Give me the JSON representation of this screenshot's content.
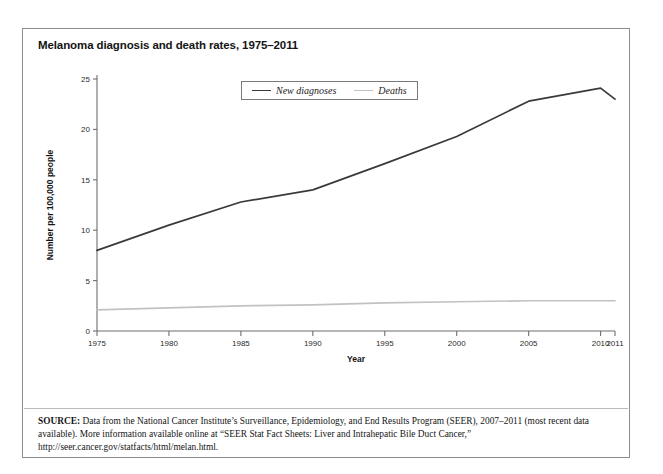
{
  "figure": {
    "title": "Melanoma diagnosis and death rates, 1975–2011",
    "source_label": "SOURCE:",
    "source_text": " Data from the National Cancer Institute’s Surveillance, Epidemiology, and End Results Program (SEER), 2007–2011 (most recent data available). More information available online at “SEER Stat Fact Sheets: Liver and Intrahepatic Bile Duct Cancer,” http://seer.cancer.gov/statfacts/html/melan.html."
  },
  "colors": {
    "frame_border": "#8c8c8c",
    "axis": "#6e6e6e",
    "new_diagnoses_line": "#3a3a3a",
    "deaths_line": "#c2c2c2",
    "title_text": "#141414",
    "note_text": "#151515"
  },
  "chart_data": {
    "type": "line",
    "title": "Melanoma diagnosis and death rates, 1975–2011",
    "xlabel": "Year",
    "ylabel": "Number per 100,000 people",
    "xlim": [
      1975,
      2011
    ],
    "ylim": [
      0,
      25
    ],
    "grid": false,
    "legend_position": "top-center",
    "x_tick_labels": [
      "1975",
      "1980",
      "1985",
      "1990",
      "1995",
      "2000",
      "2005",
      "2010",
      "2011"
    ],
    "x_ticks": [
      1975,
      1980,
      1985,
      1990,
      1995,
      2000,
      2005,
      2010,
      2011
    ],
    "y_tick_labels": [
      "0",
      "5",
      "10",
      "15",
      "20",
      "25"
    ],
    "y_ticks": [
      0,
      5,
      10,
      15,
      20,
      25
    ],
    "x": [
      1975,
      1980,
      1985,
      1990,
      1995,
      2000,
      2005,
      2010,
      2011
    ],
    "series": [
      {
        "name": "New diagnoses",
        "color": "#3a3a3a",
        "values": [
          8.0,
          10.5,
          12.8,
          14.0,
          16.6,
          19.3,
          22.8,
          24.1,
          23.0
        ]
      },
      {
        "name": "Deaths",
        "color": "#c2c2c2",
        "values": [
          2.1,
          2.3,
          2.5,
          2.6,
          2.8,
          2.9,
          3.0,
          3.0,
          3.0
        ]
      }
    ]
  }
}
